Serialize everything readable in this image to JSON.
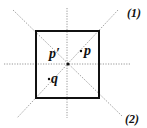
{
  "diagram": {
    "type": "geometric-figure",
    "square": {
      "x": 36,
      "y": 31,
      "width": 63,
      "height": 67,
      "stroke": "#111111"
    },
    "center": {
      "x": 68,
      "y": 64
    },
    "axes": [
      {
        "name": "horizontal",
        "x1": 4,
        "y1": 64,
        "x2": 131,
        "y2": 64
      },
      {
        "name": "vertical",
        "x1": 67,
        "y1": 8,
        "x2": 67,
        "y2": 118
      },
      {
        "name": "diagonal-1",
        "x1": 13,
        "y1": 10,
        "x2": 122,
        "y2": 116
      },
      {
        "name": "diagonal-2",
        "x1": 118,
        "y1": 10,
        "x2": 17,
        "y2": 118
      }
    ],
    "points": [
      {
        "name": "p-prime",
        "label": "p′",
        "x": 68,
        "y": 64
      },
      {
        "name": "p",
        "label": "p",
        "x": 81,
        "y": 51
      },
      {
        "name": "q",
        "label": "q",
        "x": 49,
        "y": 79
      }
    ],
    "line_labels": [
      {
        "name": "line-1",
        "label": "(1)"
      },
      {
        "name": "line-2",
        "label": "(2)"
      }
    ],
    "colors": {
      "stroke": "#111111",
      "dotted": "#8a8a8a",
      "background": "#ffffff"
    }
  }
}
